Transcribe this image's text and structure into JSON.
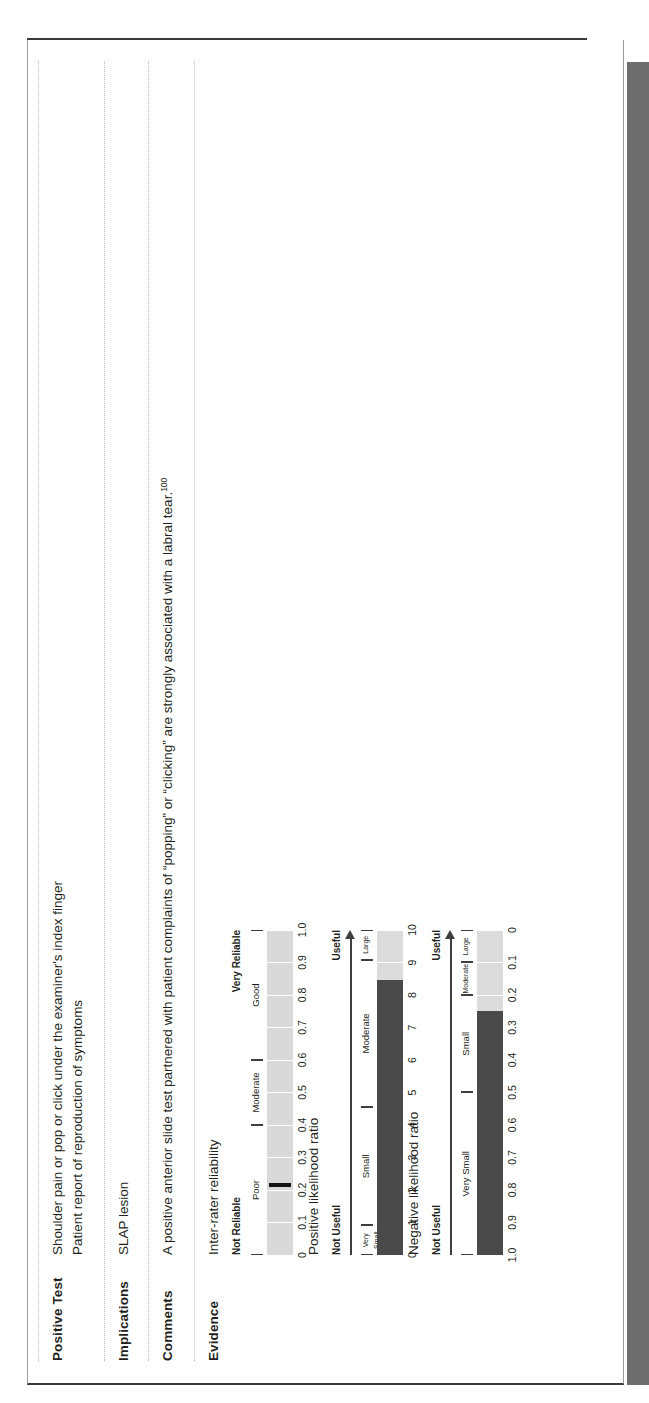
{
  "page": {
    "rows": [
      {
        "label": "Positive Test",
        "lines": [
          "Shoulder pain or pop or click under the examiner's index finger",
          "Patient report of reproduction of symptoms"
        ]
      },
      {
        "label": "Implications",
        "lines": [
          "SLAP lesion"
        ]
      },
      {
        "label": "Comments",
        "lines": [
          "A positive anterior slide test partnered with patient complaints of “popping” or “clicking” are strongly associated with a labral tear."
        ],
        "reference": "100"
      },
      {
        "label": "Evidence",
        "lines": []
      }
    ]
  },
  "chart_data": [
    {
      "type": "bar",
      "name": "inter-rater-reliability",
      "title": "Inter-rater reliability",
      "left_label": "Not Reliable",
      "right_label": "Very Reliable",
      "categories": [
        "Poor",
        "Moderate",
        "Good"
      ],
      "category_ranges": [
        [
          0.0,
          0.4
        ],
        [
          0.4,
          0.6
        ],
        [
          0.6,
          1.0
        ]
      ],
      "xlabel": "",
      "ylabel": "",
      "xlim": [
        0,
        1.0
      ],
      "ticks": [
        "0",
        "0.1",
        "0.2",
        "0.3",
        "0.4",
        "0.5",
        "0.6",
        "0.7",
        "0.8",
        "0.9",
        "1.0"
      ],
      "tick_values": [
        0,
        0.1,
        0.2,
        0.3,
        0.4,
        0.5,
        0.6,
        0.7,
        0.8,
        0.9,
        1.0
      ],
      "marker_value": 0.21,
      "grid": false,
      "legend": "none"
    },
    {
      "type": "bar",
      "name": "positive-likelihood-ratio",
      "title": "Positive likelihood ratio",
      "left_label": "Not Useful",
      "right_label": "Useful",
      "categories": [
        "Very Small",
        "Small",
        "Moderate",
        "Large"
      ],
      "category_ranges": [
        [
          0,
          1
        ],
        [
          1,
          5
        ],
        [
          5,
          10
        ],
        [
          10,
          11
        ]
      ],
      "xlabel": "",
      "ylabel": "",
      "xlim": [
        0,
        11
      ],
      "ticks": [
        "0",
        "1",
        "2",
        "3",
        "4",
        "5",
        "6",
        "7",
        "8",
        "9",
        "10"
      ],
      "tick_values": [
        0,
        1,
        2,
        3,
        4,
        5,
        6,
        7,
        8,
        9,
        10
      ],
      "value": 9.3,
      "fill_from": 0,
      "grid": false,
      "legend": "none"
    },
    {
      "type": "bar",
      "name": "negative-likelihood-ratio",
      "title": "Negative likelihood ratio",
      "left_label": "Not Useful",
      "right_label": "Useful",
      "categories": [
        "Very Small",
        "Small",
        "Moderate",
        "Large"
      ],
      "category_ranges": [
        [
          1.0,
          0.5
        ],
        [
          0.5,
          0.2
        ],
        [
          0.2,
          0.1
        ],
        [
          0.1,
          0.0
        ]
      ],
      "xlabel": "",
      "ylabel": "",
      "xlim": [
        1.0,
        0
      ],
      "ticks": [
        "1.0",
        "0.9",
        "0.8",
        "0.7",
        "0.6",
        "0.5",
        "0.4",
        "0.3",
        "0.2",
        "0.1",
        "0"
      ],
      "tick_values": [
        1.0,
        0.9,
        0.8,
        0.7,
        0.6,
        0.5,
        0.4,
        0.3,
        0.2,
        0.1,
        0.0
      ],
      "value": 0.25,
      "fill_from": 1.0,
      "grid": false,
      "legend": "none"
    }
  ],
  "colors": {
    "fill": "#4a4a4a",
    "track_light": "#e2e2e2",
    "track_mid": "#cfcfcf",
    "text": "#231f20",
    "rule": "#b9b9b9",
    "footer_band": "#6e6e6e"
  }
}
